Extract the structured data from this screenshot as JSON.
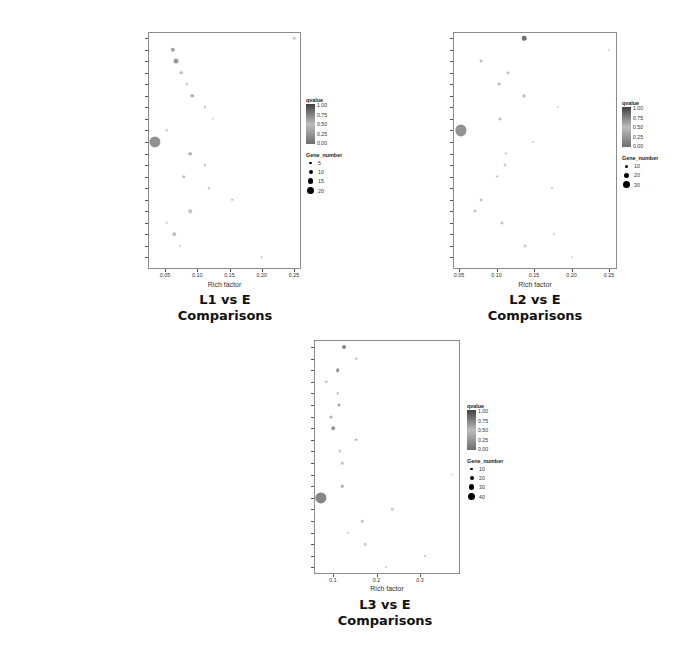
{
  "chart_data": [
    {
      "id": "L1",
      "type": "scatter",
      "title": "L1 vs E Comparisons",
      "caption_line1": "L1 vs E",
      "caption_line2": "Comparisons",
      "xlabel": "Rich factor",
      "ylabel": "",
      "xlim": [
        0.025,
        0.257
      ],
      "xticks": [
        0.05,
        0.1,
        0.15,
        0.2,
        0.25
      ],
      "xtick_labels": [
        "0.05",
        "0.10",
        "0.15",
        "0.20",
        "0.25"
      ],
      "grid": false,
      "legend_position": "right",
      "legend": {
        "color_title": "qvalue",
        "color_ticks": [
          "1.00",
          "0.75",
          "0.50",
          "0.25",
          "0.00"
        ],
        "size_title": "Gene_number",
        "size_ticks": [
          "5",
          "10",
          "15",
          "20"
        ]
      },
      "categories": [
        "Sulfur relay system",
        "Spliceosome",
        "RNA transport",
        "RNA degradation",
        "Phototransduction - fly",
        "Peroxisome",
        "Pentose phosphate pathway",
        "Nitrogen metabolism",
        "mRNA surveillance pathway",
        "Metabolic pathways",
        "Lysosome",
        "Lysine degradation",
        "Hippo signaling pathway - fly",
        "Glyoxylate and dicarboxylate metabolism",
        "Glycosaminoglycan degradation",
        "FoxO signaling pathway",
        "Endocytosis",
        "Biosynthesis of amino acids",
        "Basal transcription factors",
        "ABC transporters"
      ],
      "rich_factor": [
        0.25,
        0.062,
        0.067,
        0.075,
        0.084,
        0.092,
        0.112,
        0.124,
        0.053,
        0.034,
        0.089,
        0.112,
        0.079,
        0.118,
        0.154,
        0.089,
        0.053,
        0.064,
        0.073,
        0.2
      ],
      "gene_number": [
        1,
        3,
        4,
        2,
        1,
        2,
        1,
        1,
        1,
        20,
        2,
        1,
        2,
        1,
        1,
        2,
        1,
        2,
        1,
        1
      ],
      "qvalue": [
        0.9,
        0.6,
        0.5,
        0.85,
        0.85,
        0.7,
        0.85,
        0.95,
        0.9,
        0.45,
        0.7,
        0.85,
        0.8,
        0.9,
        0.9,
        0.85,
        0.85,
        0.85,
        0.85,
        0.95
      ]
    },
    {
      "id": "L2",
      "type": "scatter",
      "title": "L2 vs E Comparisons",
      "caption_line1": "L2 vs E",
      "caption_line2": "Comparisons",
      "xlabel": "Rich factor",
      "ylabel": "",
      "xlim": [
        0.042,
        0.259
      ],
      "xticks": [
        0.05,
        0.1,
        0.15,
        0.2,
        0.25
      ],
      "xtick_labels": [
        "0.05",
        "0.10",
        "0.15",
        "0.20",
        "0.25"
      ],
      "grid": false,
      "legend_position": "right",
      "legend": {
        "color_title": "qvalue",
        "color_ticks": [
          "1.00",
          "0.75",
          "0.50",
          "0.25",
          "0.00"
        ],
        "size_title": "Gene_number",
        "size_ticks": [
          "10",
          "20",
          "30"
        ]
      },
      "categories": [
        "Ubiquitin mediated proteolysis",
        "Sulfur relay system",
        "Ribosome biogenesis in eukaryotes",
        "Proteasome",
        "Phosphatidylinositol signaling system",
        "Peroxisome",
        "Other types of O-glycan biosynthesis",
        "mRNA surveillance pathway",
        "Metabolic pathways",
        "Lysine degradation",
        "Inositol phosphate metabolism",
        "FoxO signaling pathway",
        "Fatty acid metabolism",
        "Fatty acid degradation",
        "Endocytosis",
        "Carbon metabolism",
        "Biosynthesis of amino acids",
        "beta-Alanine metabolism",
        "Arginine and proline metabolism",
        "ABC transporters"
      ],
      "rich_factor": [
        0.137,
        0.25,
        0.079,
        0.115,
        0.103,
        0.137,
        0.182,
        0.105,
        0.053,
        0.149,
        0.113,
        0.111,
        0.101,
        0.174,
        0.079,
        0.071,
        0.107,
        0.177,
        0.138,
        0.2
      ],
      "gene_number": [
        5,
        1,
        2,
        2,
        2,
        2,
        1,
        2,
        30,
        1,
        2,
        2,
        2,
        1,
        2,
        2,
        2,
        1,
        2,
        1
      ],
      "qvalue": [
        0.2,
        0.95,
        0.8,
        0.85,
        0.75,
        0.75,
        0.95,
        0.8,
        0.45,
        0.85,
        0.9,
        0.9,
        0.9,
        0.85,
        0.85,
        0.85,
        0.85,
        0.9,
        0.9,
        0.95
      ]
    },
    {
      "id": "L3",
      "type": "scatter",
      "title": "L3 vs E Comparisons",
      "caption_line1": "L3  vs E",
      "caption_line2": "Comparisons",
      "xlabel": "Rich factor",
      "ylabel": "",
      "xlim": [
        0.057,
        0.39
      ],
      "xticks": [
        0.1,
        0.2,
        0.3
      ],
      "xtick_labels": [
        "0.1",
        "0.2",
        "0.3"
      ],
      "grid": false,
      "legend_position": "right",
      "legend": {
        "color_title": "qvalue",
        "color_ticks": [
          "1.00",
          "0.75",
          "0.50",
          "0.25",
          "0.00"
        ],
        "size_title": "Gene_number",
        "size_ticks": [
          "10",
          "20",
          "30",
          "40"
        ]
      },
      "categories": [
        "Ubiquitin mediated proteolysis",
        "TGF-beta signaling pathway",
        "Spliceosome",
        "RNA transport",
        "RNA degradation",
        "Pyrimidine metabolism",
        "Purine metabolism",
        "Protein processing in endoplasmic reticulum",
        "Phosphatidylinositol signaling system",
        "Phagosome",
        "N-Glycan biosynthesis",
        "Mucin type O-Glycan biosynthesis",
        "mRNA surveillance pathway",
        "Metabolic pathways",
        "Jak-STAT signaling pathway",
        "Inositol phosphate metabolism",
        "Fatty acid metabolism",
        "Fatty acid degradation",
        "ECM-receptor interaction",
        "Biosynthesis of unsaturated fatty acids"
      ],
      "rich_factor": [
        0.125,
        0.153,
        0.111,
        0.084,
        0.111,
        0.114,
        0.095,
        0.1,
        0.153,
        0.116,
        0.121,
        0.374,
        0.121,
        0.072,
        0.236,
        0.167,
        0.134,
        0.174,
        0.311,
        0.222
      ],
      "gene_number": [
        5,
        2,
        4,
        2,
        2,
        3,
        3,
        4,
        2,
        2,
        2,
        1,
        2,
        40,
        2,
        2,
        2,
        2,
        1,
        1
      ],
      "qvalue": [
        0.35,
        0.85,
        0.45,
        0.8,
        0.8,
        0.6,
        0.65,
        0.5,
        0.75,
        0.8,
        0.85,
        0.9,
        0.65,
        0.35,
        0.9,
        0.85,
        0.9,
        0.9,
        0.85,
        0.95
      ]
    }
  ],
  "layout": {
    "panels": [
      {
        "left": 148,
        "top": 32,
        "width": 153,
        "height": 237,
        "label_right": 145,
        "row_start": 38,
        "row_step": 11.55,
        "x0_px": 165,
        "x0_val": 0.05,
        "px_per_unit": 645,
        "xtick_y": 272,
        "xtitle_y": 281,
        "caption_x": 225,
        "caption_y": 292,
        "legend_x": 306,
        "legend_y": 97,
        "size_px": [
          2.5,
          4,
          5.5,
          7
        ]
      },
      {
        "left": 453,
        "top": 32,
        "width": 164,
        "height": 237,
        "label_right": 451,
        "row_start": 38,
        "row_step": 11.55,
        "x0_px": 459,
        "x0_val": 0.05,
        "px_per_unit": 750,
        "xtick_y": 272,
        "xtitle_y": 281,
        "caption_x": 535,
        "caption_y": 292,
        "legend_x": 622,
        "legend_y": 100,
        "size_px": [
          3,
          5,
          7
        ]
      },
      {
        "left": 314,
        "top": 340,
        "width": 146,
        "height": 234,
        "label_right": 312,
        "row_start": 347,
        "row_step": 11.6,
        "x0_px": 333,
        "x0_val": 0.1,
        "px_per_unit": 435,
        "xtick_y": 577,
        "xtitle_y": 585,
        "caption_x": 385,
        "caption_y": 597,
        "legend_x": 467,
        "legend_y": 403,
        "size_px": [
          2.5,
          4,
          5.5,
          7
        ]
      }
    ]
  }
}
